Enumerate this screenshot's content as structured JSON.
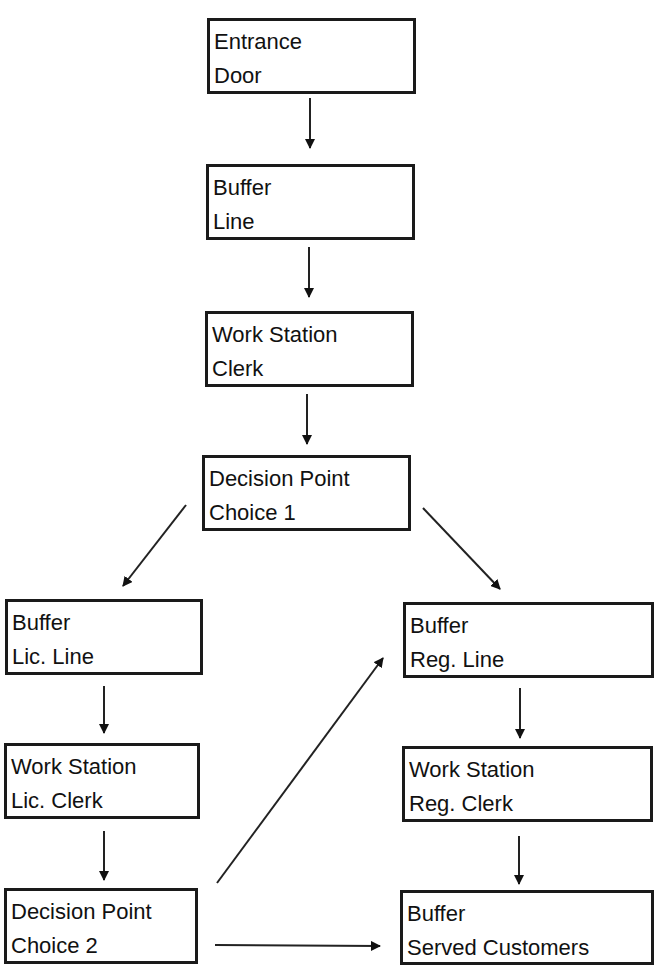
{
  "nodes": [
    {
      "id": "entrance",
      "line1": "Entrance",
      "line2": "Door"
    },
    {
      "id": "buffer-line",
      "line1": "Buffer",
      "line2": "Line"
    },
    {
      "id": "ws-clerk",
      "line1": "Work Station",
      "line2": "Clerk"
    },
    {
      "id": "decision1",
      "line1": "Decision Point",
      "line2": "Choice 1"
    },
    {
      "id": "buffer-lic",
      "line1": "Buffer",
      "line2": "Lic. Line"
    },
    {
      "id": "ws-lic",
      "line1": "Work Station",
      "line2": "Lic. Clerk"
    },
    {
      "id": "decision2",
      "line1": "Decision Point",
      "line2": "Choice 2"
    },
    {
      "id": "buffer-reg",
      "line1": "Buffer",
      "line2": "Reg. Line"
    },
    {
      "id": "ws-reg",
      "line1": "Work Station",
      "line2": "Reg. Clerk"
    },
    {
      "id": "buffer-served",
      "line1": "Buffer",
      "line2": "Served Customers"
    }
  ],
  "edges": [
    [
      "entrance",
      "buffer-line"
    ],
    [
      "buffer-line",
      "ws-clerk"
    ],
    [
      "ws-clerk",
      "decision1"
    ],
    [
      "decision1",
      "buffer-lic"
    ],
    [
      "decision1",
      "buffer-reg"
    ],
    [
      "buffer-lic",
      "ws-lic"
    ],
    [
      "ws-lic",
      "decision2"
    ],
    [
      "decision2",
      "buffer-reg"
    ],
    [
      "decision2",
      "buffer-served"
    ],
    [
      "buffer-reg",
      "ws-reg"
    ],
    [
      "ws-reg",
      "buffer-served"
    ]
  ]
}
